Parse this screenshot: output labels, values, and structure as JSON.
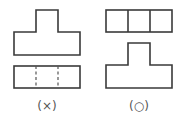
{
  "figure": {
    "panels": [
      {
        "id": "left",
        "label": "(×)",
        "verdict": "incorrect",
        "top_view": "T-shaped outline (narrow top block on wide base)",
        "bottom_view": "rectangle with two dashed hidden lines"
      },
      {
        "id": "right",
        "label": "(○)",
        "verdict": "correct",
        "top_view": "rectangle divided into three squares",
        "bottom_view": "T-shaped outline (narrow top block on wide base)"
      }
    ],
    "colors": {
      "stroke": "#3a3a3a",
      "label": "#555555",
      "background": "#ffffff"
    }
  }
}
